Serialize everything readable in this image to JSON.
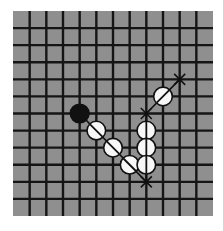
{
  "game": {
    "type": "gomoku",
    "board": {
      "cells_x": 12,
      "cells_y": 12,
      "lines": 11,
      "background_color": "#8f8f8f",
      "line_color": "#151515",
      "origin_px": [
        13,
        11
      ],
      "size_px": [
        200,
        205
      ]
    },
    "stones": [
      {
        "color": "black",
        "col": 3,
        "row": 5,
        "marker": "none"
      },
      {
        "color": "white",
        "col": 4,
        "row": 6,
        "marker": "diag-down"
      },
      {
        "color": "white",
        "col": 5,
        "row": 7,
        "marker": "diag-down"
      },
      {
        "color": "white",
        "col": 6,
        "row": 8,
        "marker": "diag-down"
      },
      {
        "color": "white",
        "col": 7,
        "row": 6,
        "marker": "vertical"
      },
      {
        "color": "white",
        "col": 7,
        "row": 7,
        "marker": "vertical"
      },
      {
        "color": "white",
        "col": 7,
        "row": 8,
        "marker": "vertical"
      },
      {
        "color": "white",
        "col": 8,
        "row": 4,
        "marker": "diag-up"
      }
    ],
    "x_marks": [
      {
        "col": 7,
        "row": 9
      },
      {
        "col": 7,
        "row": 5
      },
      {
        "col": 9,
        "row": 3
      }
    ],
    "threat_lines": [
      {
        "from": [
          3,
          5
        ],
        "to": [
          7,
          9
        ],
        "direction": "diagonal-down"
      },
      {
        "from": [
          7,
          5
        ],
        "to": [
          7,
          9
        ],
        "direction": "vertical"
      },
      {
        "from": [
          7,
          5
        ],
        "to": [
          9,
          3
        ],
        "direction": "diagonal-up"
      }
    ],
    "colors": {
      "black_stone": "#111111",
      "white_stone": "#f7f7f7",
      "stone_outline": "#111111"
    }
  }
}
